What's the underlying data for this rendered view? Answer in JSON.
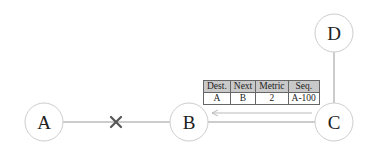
{
  "diagram": {
    "nodes": [
      {
        "id": "A",
        "label": "A",
        "cx": 44,
        "cy": 122
      },
      {
        "id": "B",
        "label": "B",
        "cx": 189,
        "cy": 122
      },
      {
        "id": "C",
        "label": "C",
        "cx": 334,
        "cy": 122
      },
      {
        "id": "D",
        "label": "D",
        "cx": 334,
        "cy": 33
      }
    ],
    "links": [
      {
        "from": "A",
        "to": "B",
        "status": "broken",
        "marker": "×"
      },
      {
        "from": "B",
        "to": "C",
        "status": "ok"
      },
      {
        "from": "C",
        "to": "D",
        "status": "ok"
      }
    ],
    "advertisement_arrow": {
      "from": "C",
      "to": "B"
    },
    "route_table": {
      "headers": [
        "Dest.",
        "Next",
        "Metric",
        "Seq."
      ],
      "rows": [
        [
          "A",
          "B",
          "2",
          "A-100"
        ]
      ]
    },
    "colors": {
      "line": "#999999",
      "node_border": "#cccccc",
      "marker": "#555555",
      "table_header": "#c9c9c9"
    }
  }
}
